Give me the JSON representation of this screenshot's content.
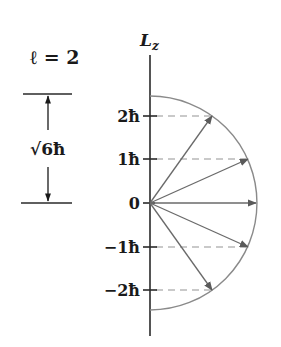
{
  "title": "ℓ = 2",
  "axis": {
    "label_main": "L",
    "label_sub": "z"
  },
  "magnitude_label": {
    "root": "√6",
    "unit": "ħ"
  },
  "ticks": [
    {
      "label": "2ħ",
      "m": 2
    },
    {
      "label": "1ħ",
      "m": 1
    },
    {
      "label": "0",
      "m": 0
    },
    {
      "label": "−1ħ",
      "m": -1
    },
    {
      "label": "−2ħ",
      "m": -2
    }
  ],
  "colors": {
    "axis": "#2a2a2a",
    "arc": "#8a8a8a",
    "vector": "#6a6a6a",
    "dashed": "#b8b8b8",
    "text": "#1a1a1a"
  }
}
